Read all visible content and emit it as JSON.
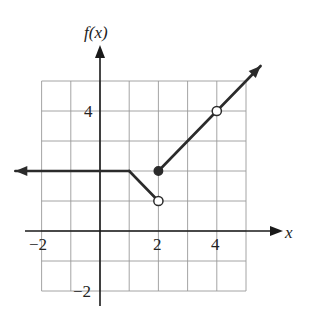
{
  "chart_data": {
    "type": "line",
    "title": "",
    "xlabel": "x",
    "ylabel": "f(x)",
    "xlim": [
      -2,
      5
    ],
    "ylim": [
      -2,
      5
    ],
    "grid": true,
    "x_ticks": [
      -2,
      2,
      4
    ],
    "y_ticks": [
      4,
      -2
    ],
    "tick_labels": {
      "x_neg2": "−2",
      "x_2": "2",
      "x_4": "4",
      "y_4": "4",
      "y_neg2": "−2"
    },
    "series": [
      {
        "name": "constant piece",
        "points": [
          [
            -2.9,
            2
          ],
          [
            1,
            2
          ]
        ],
        "left_arrow": true,
        "description": "f(x) = 2 for x <= 1, extends to -infinity"
      },
      {
        "name": "decreasing piece",
        "points": [
          [
            1,
            2
          ],
          [
            2,
            1
          ]
        ],
        "description": "f(x) = 3 - x for 1 <= x < 2"
      },
      {
        "name": "increasing piece",
        "points": [
          [
            2,
            2
          ],
          [
            5.5,
            5.5
          ]
        ],
        "right_arrow": true,
        "description": "f(x) = x for x >= 2, x != 4"
      }
    ],
    "markers": [
      {
        "x": 2,
        "y": 1,
        "type": "open"
      },
      {
        "x": 2,
        "y": 2,
        "type": "filled"
      },
      {
        "x": 4,
        "y": 4,
        "type": "open"
      }
    ]
  },
  "labels": {
    "y_axis": "f(x)",
    "x_axis": "x"
  }
}
